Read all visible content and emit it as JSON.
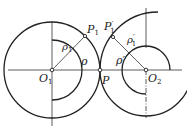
{
  "diagram": {
    "type": "geometry-figure",
    "colors": {
      "stroke": "#222222",
      "background": "#ffffff"
    },
    "labels": {
      "O1": {
        "base": "O",
        "sub": "1"
      },
      "O2": {
        "base": "O",
        "sub": "2"
      },
      "P": "P",
      "P1": {
        "base": "P",
        "sub": "1"
      },
      "P1prime": {
        "base": "P",
        "sup": "′",
        "sub": "1"
      },
      "rho": "ρ",
      "rho1": {
        "base": "ρ",
        "sub": "1"
      },
      "rho_prime": "ρ′",
      "rho1_prime": {
        "base": "ρ",
        "sup": "′",
        "sub": "1"
      }
    },
    "points": {
      "O1": [
        52,
        70
      ],
      "O2": [
        146,
        70
      ],
      "P": [
        100,
        70
      ],
      "P1": [
        85,
        36
      ],
      "P1prime": [
        113,
        37
      ]
    }
  }
}
